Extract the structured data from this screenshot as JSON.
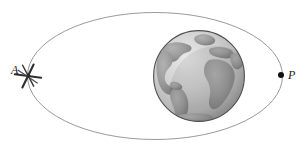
{
  "figure": {
    "background_color": "#ffffff",
    "width": 306,
    "height": 165
  },
  "orbit": {
    "name": "orbit-ellipse",
    "center_x": 155,
    "center_y": 76,
    "radius_x": 128,
    "radius_y": 64,
    "stroke_color": "#8c8c8c",
    "stroke_width": 0.9,
    "fill": "none"
  },
  "earth": {
    "name": "earth-globe",
    "center_x": 199,
    "center_y": 76,
    "radius": 46,
    "outline_color": "#4a4a4a",
    "ocean_color": "#c9c9c9",
    "land_color": "#9a9a9a",
    "highlight_color": "#e2e2e2",
    "shadow_color": "#6f6f6f"
  },
  "markers": [
    {
      "name": "apogee-marker",
      "kind": "spacecraft-icon",
      "x": 28,
      "y": 76,
      "color": "#2b2b2b",
      "label": "A"
    },
    {
      "name": "perigee-marker",
      "kind": "point-dot",
      "x": 281,
      "y": 75,
      "radius": 3,
      "color": "#111111",
      "label": "P"
    }
  ],
  "labels": {
    "apogee": "A",
    "perigee": "P"
  }
}
